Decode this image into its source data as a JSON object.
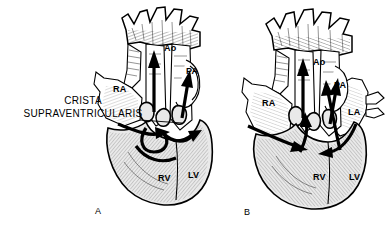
{
  "figure": {
    "type": "medical-illustration",
    "background_color": "#ffffff",
    "ink_color": "#000000",
    "panel_count": 2
  },
  "panels": [
    {
      "id": "A",
      "caption": "A",
      "caption_x": 95,
      "caption_y": 212,
      "description": "Left heart diagram with crista supraventricularis annotated",
      "labels": [
        {
          "text": "Ao",
          "name": "label-ao-a",
          "x": 164,
          "y": 48,
          "desc": "Aorta"
        },
        {
          "text": "PA",
          "name": "label-pa-a",
          "x": 186,
          "y": 71,
          "desc": "Pulmonary artery"
        },
        {
          "text": "RA",
          "name": "label-ra-a",
          "x": 122,
          "y": 89,
          "desc": "Right atrium"
        },
        {
          "text": "RV",
          "name": "label-rv-a",
          "x": 163,
          "y": 178,
          "desc": "Right ventricle"
        },
        {
          "text": "LV",
          "name": "label-lv-a",
          "x": 192,
          "y": 175,
          "desc": "Left ventricle"
        }
      ],
      "annotation": {
        "line1": "CRISTA",
        "line2": "SUPRAVENTRICULARIS",
        "x": 22,
        "y": 99,
        "leader_from_x": 140,
        "leader_from_y": 120,
        "leader_to_x": 182,
        "leader_to_y": 123
      }
    },
    {
      "id": "B",
      "caption": "B",
      "caption_x": 244,
      "caption_y": 213,
      "description": "Right heart diagram showing all four chambers and flow arrows",
      "labels": [
        {
          "text": "Ao",
          "name": "label-ao-b",
          "x": 313,
          "y": 62,
          "desc": "Aorta"
        },
        {
          "text": "PA",
          "name": "label-pa-b",
          "x": 334,
          "y": 85,
          "desc": "Pulmonary artery"
        },
        {
          "text": "RA",
          "name": "label-ra-b",
          "x": 265,
          "y": 103,
          "desc": "Right atrium"
        },
        {
          "text": "LA",
          "name": "label-la-b",
          "x": 351,
          "y": 112,
          "desc": "Left atrium"
        },
        {
          "text": "RV",
          "name": "label-rv-b",
          "x": 318,
          "y": 177,
          "desc": "Right ventricle"
        },
        {
          "text": "LV",
          "name": "label-lv-b",
          "x": 353,
          "y": 177,
          "desc": "Left ventricle"
        }
      ],
      "annotation": null
    }
  ],
  "legend_terms": {
    "Ao": "Aorta",
    "PA": "Pulmonary artery",
    "RA": "Right atrium",
    "LA": "Left atrium",
    "RV": "Right ventricle",
    "LV": "Left ventricle",
    "CRISTA SUPRAVENTRICULARIS": "Muscular ridge in the right ventricle"
  }
}
